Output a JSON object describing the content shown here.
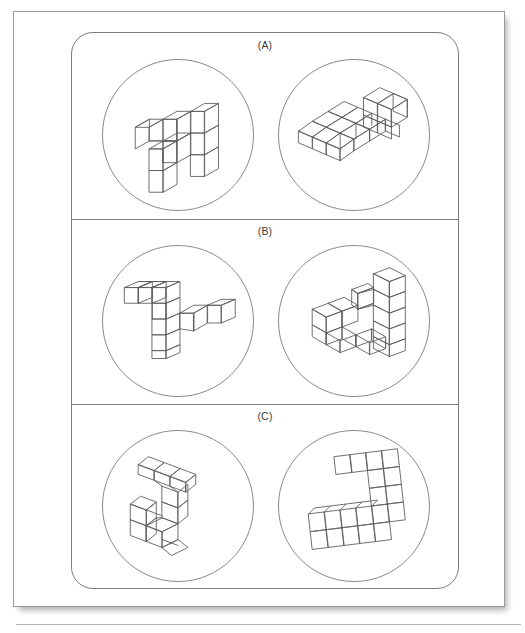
{
  "document": {
    "type": "scanned-figure-page",
    "title": "Mental rotation stimulus panels",
    "page_background": "#ffffff",
    "ink_color": "#5e5e5e",
    "frame_color": "#7c7c7c"
  },
  "panels": [
    {
      "id": "a",
      "label": "(A)",
      "circles": [
        {
          "id": "a-left",
          "position": "left",
          "figure_name": "cube-assembly-a-left",
          "description": "Isometric block figure made of unit cubes, viewed from upper-left"
        },
        {
          "id": "a-right",
          "position": "right",
          "figure_name": "cube-assembly-a-right",
          "description": "Same block figure rotated, flatter viewing angle"
        }
      ]
    },
    {
      "id": "b",
      "label": "(B)",
      "circles": [
        {
          "id": "b-left",
          "position": "left",
          "figure_name": "cube-assembly-b-left",
          "description": "Z-shaped isometric block figure of unit cubes"
        },
        {
          "id": "b-right",
          "position": "right",
          "figure_name": "cube-assembly-b-right",
          "description": "Rotated view of the Z-shaped block figure, taller stack on the right"
        }
      ]
    },
    {
      "id": "c",
      "label": "(C)",
      "circles": [
        {
          "id": "c-left",
          "position": "left",
          "figure_name": "cube-assembly-c-left",
          "description": "Flat zig-zag tile figure seen at a shallow oblique angle"
        },
        {
          "id": "c-right",
          "position": "right",
          "figure_name": "cube-assembly-c-right",
          "description": "Flat zig-zag tile figure rotated, S / Z outline"
        }
      ]
    }
  ]
}
